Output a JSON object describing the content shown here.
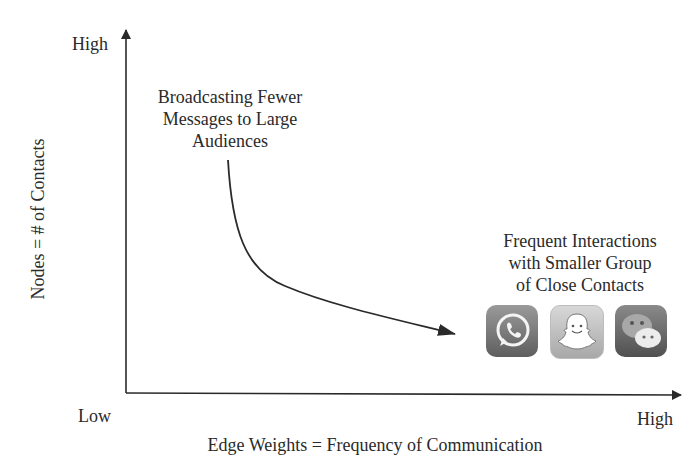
{
  "diagram": {
    "y_axis": {
      "title": "Nodes = # of Contacts",
      "high_label": "High"
    },
    "x_axis": {
      "title": "Edge Weights = Frequency of Communication",
      "low_label": "Low",
      "high_label": "High"
    },
    "annotations": {
      "top_left": [
        "Broadcasting Fewer",
        "Messages to Large",
        "Audiences"
      ],
      "bottom_right": [
        "Frequent Interactions",
        "with Smaller Group",
        "of Close Contacts"
      ]
    },
    "icons": [
      {
        "name": "whatsapp-icon",
        "label": "WhatsApp"
      },
      {
        "name": "snapchat-icon",
        "label": "Snapchat"
      },
      {
        "name": "wechat-icon",
        "label": "WeChat"
      }
    ],
    "colors": {
      "axis": "#2a2a2a",
      "text": "#2a2a2a",
      "icon_dark": "#6e6e6e",
      "icon_light": "#c8c8c8"
    }
  }
}
